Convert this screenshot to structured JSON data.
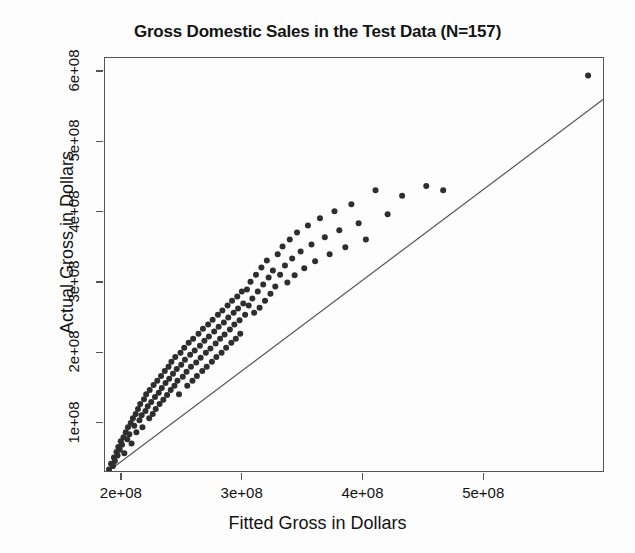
{
  "chart_data": {
    "type": "scatter",
    "title": "Gross Domestic Sales in the Test Data (N=157)",
    "xlabel": "Fitted Gross in Dollars",
    "ylabel": "Actual Gross in Dollars",
    "xlim": [
      186000000,
      600000000
    ],
    "ylim": [
      30000000,
      620000000
    ],
    "grid": false,
    "legend": null,
    "xticks": [
      200000000,
      300000000,
      400000000,
      500000000
    ],
    "xticklabels": [
      "2e+08",
      "3e+08",
      "4e+08",
      "5e+08"
    ],
    "yticks": [
      100000000,
      200000000,
      300000000,
      400000000,
      500000000,
      600000000
    ],
    "yticklabels": [
      "1e+08",
      "2e+08",
      "3e+08",
      "4e+08",
      "5e+08",
      "6e+08"
    ],
    "n_points": 157,
    "point_color": "#2e2e2e",
    "point_size": 6,
    "line_color": "#555555",
    "frame_color": "#555555",
    "background_color": "#ffffff",
    "fit_line": {
      "label": "identity / regression reference line",
      "x_start": 188700000,
      "y_start": 32500000,
      "x_end": 600000000,
      "y_end": 563000000
    },
    "x": [
      189.3,
      191.0,
      192.6,
      193.4,
      194.2,
      195.5,
      196.4,
      197.0,
      198.2,
      199.0,
      200.1,
      201.3,
      202.0,
      203.2,
      204.4,
      205.0,
      206.2,
      207.3,
      208.0,
      209.1,
      210.2,
      211.4,
      212.0,
      213.3,
      214.5,
      215.2,
      216.4,
      217.0,
      218.3,
      219.5,
      220.1,
      221.4,
      222.6,
      223.0,
      224.3,
      225.5,
      226.2,
      227.4,
      228.0,
      229.3,
      230.5,
      231.2,
      232.4,
      233.0,
      234.3,
      235.5,
      236.1,
      237.4,
      238.6,
      239.2,
      240.4,
      241.0,
      242.3,
      243.5,
      244.2,
      245.4,
      246.0,
      247.3,
      248.5,
      249.1,
      250.4,
      251.6,
      252.2,
      253.5,
      254.1,
      255.3,
      256.5,
      257.2,
      258.4,
      259.0,
      260.3,
      261.5,
      262.1,
      263.4,
      264.6,
      265.2,
      266.5,
      267.1,
      268.3,
      269.5,
      270.2,
      271.4,
      272.0,
      273.3,
      274.5,
      275.1,
      276.4,
      277.6,
      278.2,
      279.5,
      280.1,
      281.3,
      282.5,
      283.2,
      284.4,
      285.0,
      286.3,
      287.5,
      288.1,
      289.4,
      290.6,
      291.2,
      292.5,
      293.1,
      294.3,
      295.5,
      296.2,
      297.4,
      298.0,
      299.3,
      300.5,
      302.0,
      303.5,
      305.0,
      306.5,
      308.0,
      309.5,
      311.0,
      312.5,
      314.0,
      315.5,
      317.0,
      318.5,
      320.0,
      321.5,
      323.0,
      325.0,
      327.0,
      329.0,
      331.0,
      333.0,
      335.0,
      337.0,
      339.0,
      341.0,
      343.0,
      345.0,
      348.0,
      351.0,
      354.0,
      357.0,
      360.0,
      364.0,
      368.0,
      372.0,
      376.0,
      380.0,
      385.0,
      390.0,
      396.0,
      402.0,
      410.0,
      420.0,
      432.0,
      452.0,
      466.0,
      586.0
    ],
    "y": [
      35.0,
      43.0,
      40.0,
      52.0,
      47.0,
      60.0,
      55.0,
      67.0,
      63.0,
      75.0,
      70.0,
      81.0,
      58.0,
      88.0,
      78.0,
      95.0,
      85.0,
      101.0,
      72.0,
      108.0,
      97.0,
      114.0,
      88.0,
      121.0,
      105.0,
      128.0,
      112.0,
      95.0,
      135.0,
      118.0,
      142.0,
      125.0,
      108.0,
      148.0,
      131.0,
      114.0,
      155.0,
      138.0,
      121.0,
      161.0,
      144.0,
      128.0,
      168.0,
      151.0,
      134.0,
      175.0,
      158.0,
      141.0,
      181.0,
      164.0,
      148.0,
      188.0,
      171.0,
      154.0,
      195.0,
      178.0,
      161.0,
      142.0,
      201.0,
      184.0,
      167.0,
      208.0,
      191.0,
      174.0,
      154.0,
      215.0,
      198.0,
      181.0,
      161.0,
      221.0,
      204.0,
      187.0,
      168.0,
      228.0,
      211.0,
      194.0,
      175.0,
      235.0,
      218.0,
      201.0,
      181.0,
      241.0,
      224.0,
      207.0,
      188.0,
      248.0,
      231.0,
      214.0,
      195.0,
      255.0,
      238.0,
      221.0,
      201.0,
      261.0,
      244.0,
      227.0,
      208.0,
      268.0,
      251.0,
      234.0,
      215.0,
      275.0,
      258.0,
      241.0,
      221.0,
      281.0,
      264.0,
      247.0,
      228.0,
      288.0,
      271.0,
      255.0,
      291.0,
      268.0,
      302.0,
      278.0,
      258.0,
      312.0,
      288.0,
      265.0,
      322.0,
      298.0,
      275.0,
      332.0,
      308.0,
      285.0,
      318.0,
      295.0,
      341.0,
      312.0,
      352.0,
      325.0,
      301.0,
      362.0,
      335.0,
      311.0,
      372.0,
      345.0,
      321.0,
      382.0,
      355.0,
      331.0,
      392.0,
      365.0,
      341.0,
      402.0,
      375.0,
      351.0,
      412.0,
      385.0,
      362.0,
      432.0,
      398.0,
      424.0,
      438.0,
      432.0,
      595.0
    ]
  }
}
